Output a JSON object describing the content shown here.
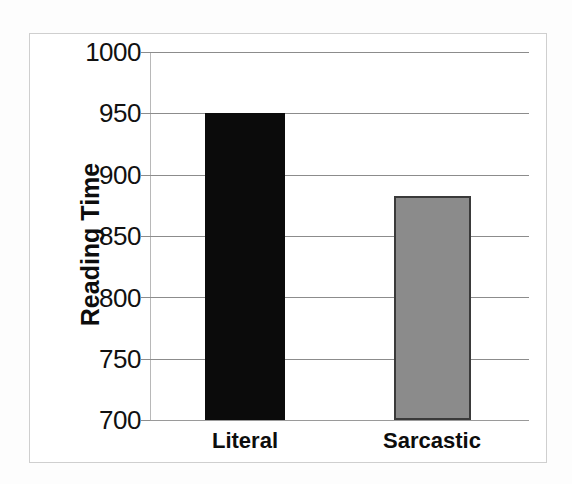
{
  "chart_data": {
    "type": "bar",
    "title": "",
    "subtitle": "",
    "xlabel": "",
    "ylabel": "Reading Time",
    "categories": [
      "Literal",
      "Sarcastic"
    ],
    "values": [
      950,
      883
    ],
    "series": [
      {
        "name": "Reading Time",
        "values": [
          950,
          883
        ],
        "colors": [
          "#0b0b0b",
          "#8b8b8b"
        ]
      }
    ],
    "ylim": [
      700,
      1000
    ],
    "ytick_labels": [
      "1000",
      "950",
      "900",
      "850",
      "800",
      "750",
      "700"
    ],
    "ytick_values": [
      1000,
      950,
      900,
      850,
      800,
      750,
      700
    ],
    "grid": "horizontal",
    "legend": "none",
    "annotations": []
  },
  "axis": {
    "y_title": "Reading Time",
    "y_ticks": [
      {
        "label": "1000",
        "value": 1000
      },
      {
        "label": "950",
        "value": 950
      },
      {
        "label": "900",
        "value": 900
      },
      {
        "label": "850",
        "value": 850
      },
      {
        "label": "800",
        "value": 800
      },
      {
        "label": "750",
        "value": 750
      },
      {
        "label": "700",
        "value": 700
      }
    ]
  },
  "bars": [
    {
      "label": "Literal",
      "value": 950,
      "color": "#0b0b0b"
    },
    {
      "label": "Sarcastic",
      "value": 883,
      "color": "#8b8b8b"
    }
  ],
  "colors": {
    "literal_bar": "#0b0b0b",
    "sarcastic_bar": "#8b8b8b",
    "sarcastic_bar_border": "#3a3a3a",
    "gridline": "#8c8c8c",
    "frame": "#cfcfcf",
    "background": "#ffffff",
    "text": "#0d0d0d"
  }
}
